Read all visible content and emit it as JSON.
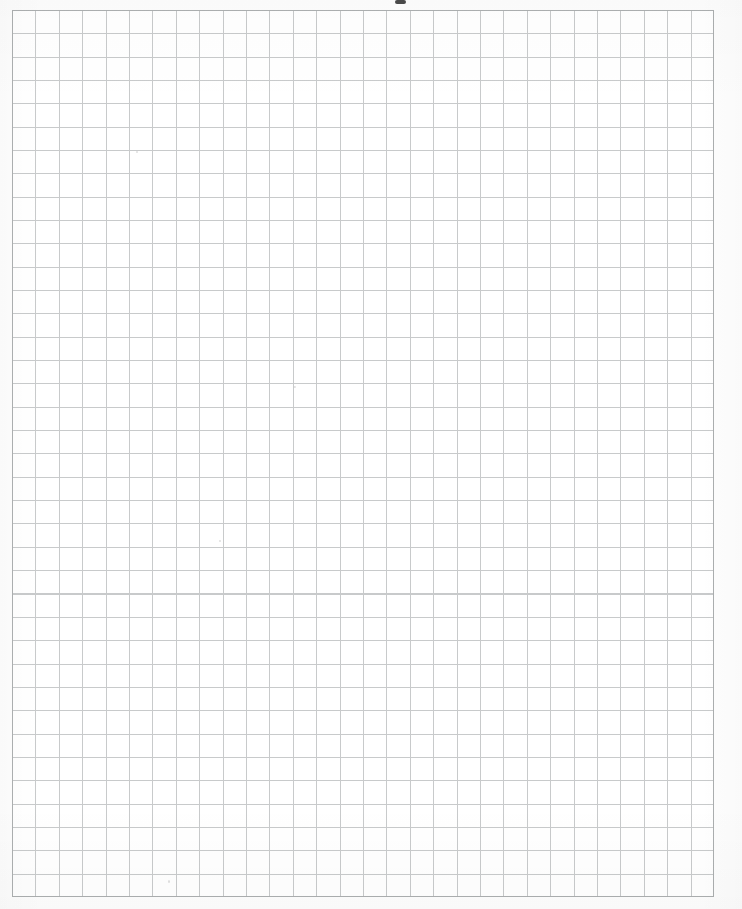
{
  "document": {
    "kind": "graph-paper-scan",
    "title": "Blank Graph Paper Sheet",
    "page_width": 742,
    "page_height": 909,
    "background_color": "#fdfdfd",
    "has_text_content": false,
    "visible_text": ""
  },
  "grid": {
    "label": "Square grid",
    "columns": 30,
    "rows": 38,
    "cell_width": 23.4,
    "cell_height": 23.34,
    "origin_x": 12,
    "origin_y": 10,
    "width": 702,
    "height": 887,
    "line_color": "#b9bcbd",
    "border_color": "#a9acad",
    "line_width": 1
  },
  "artifacts": {
    "top_smudge": {
      "name": "scan-smudge",
      "x": 395,
      "y": 0,
      "width": 11,
      "height": 4,
      "color": "#2a2a2a"
    },
    "specks": [
      {
        "x": 136,
        "y": 151
      },
      {
        "x": 293,
        "y": 386
      },
      {
        "x": 219,
        "y": 540
      },
      {
        "x": 168,
        "y": 880
      }
    ]
  },
  "chart_data": {
    "type": "table",
    "xlabel": "",
    "ylabel": "",
    "categories": [],
    "values": [],
    "grid": true,
    "legend_position": "none",
    "note": "Empty ruled grid: no plotted data, no axis tick labels, no legend, no annotations."
  }
}
